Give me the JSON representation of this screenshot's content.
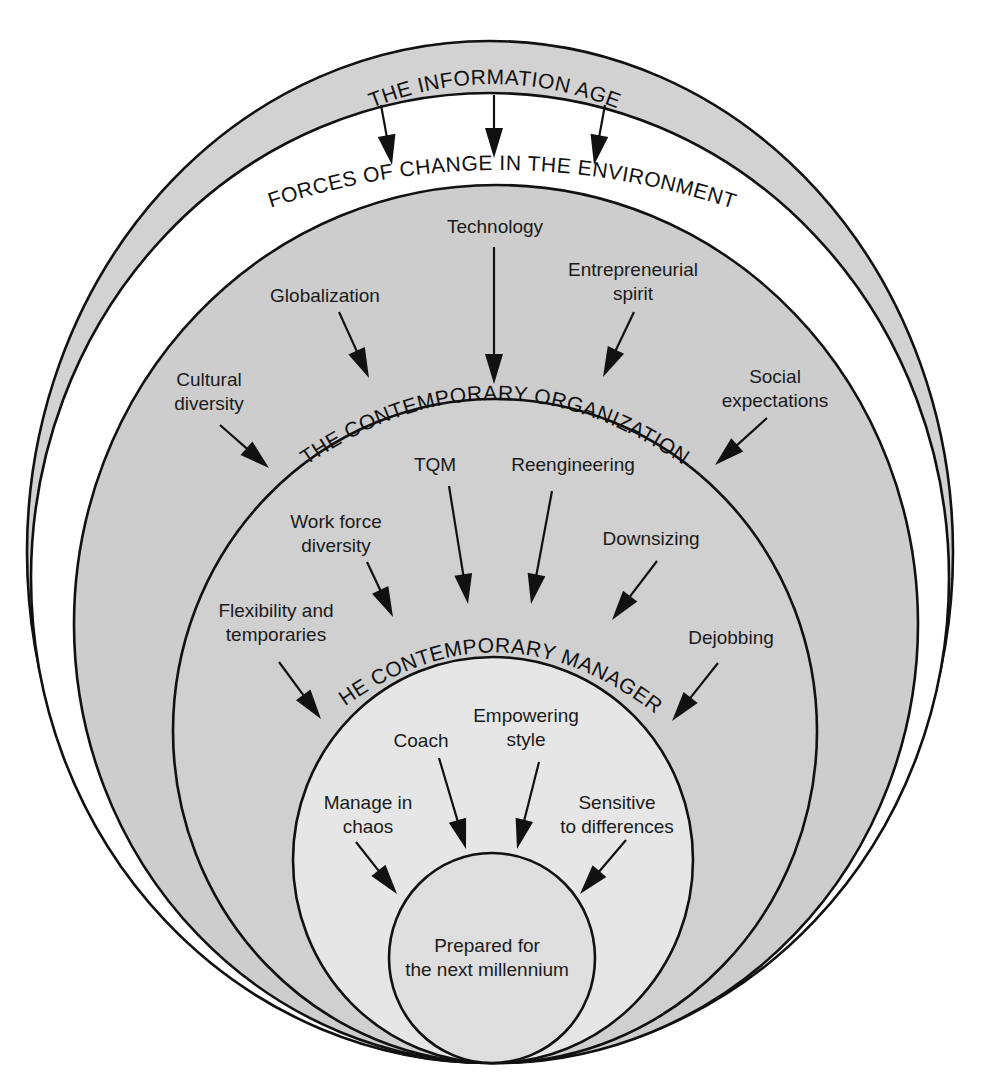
{
  "diagram": {
    "colors": {
      "outer_band": "#d2d2d2",
      "environment_band": "#ffffff",
      "environment_fill": "#cdcdcd",
      "organization_fill": "#d0d0d0",
      "manager_fill": "#e6e6e6",
      "core_fill": "#dedede",
      "line": "#111111"
    },
    "layers": [
      {
        "id": "information-age",
        "label": "THE INFORMATION AGE"
      },
      {
        "id": "environment",
        "label": "FORCES OF CHANGE IN THE ENVIRONMENT"
      },
      {
        "id": "organization",
        "label": "THE CONTEMPORARY ORGANIZATION"
      },
      {
        "id": "manager",
        "label": "THE CONTEMPORARY MANAGER"
      },
      {
        "id": "core",
        "label_lines": [
          "Prepared for",
          "the next millennium"
        ]
      }
    ],
    "environment_forces": [
      {
        "lines": [
          "Technology"
        ]
      },
      {
        "lines": [
          "Globalization"
        ]
      },
      {
        "lines": [
          "Entrepreneurial",
          "spirit"
        ]
      },
      {
        "lines": [
          "Cultural",
          "diversity"
        ]
      },
      {
        "lines": [
          "Social",
          "expectations"
        ]
      }
    ],
    "organization_forces": [
      {
        "lines": [
          "TQM"
        ]
      },
      {
        "lines": [
          "Reengineering"
        ]
      },
      {
        "lines": [
          "Work force",
          "diversity"
        ]
      },
      {
        "lines": [
          "Downsizing"
        ]
      },
      {
        "lines": [
          "Flexibility and",
          "temporaries"
        ]
      },
      {
        "lines": [
          "Dejobbing"
        ]
      }
    ],
    "manager_traits": [
      {
        "lines": [
          "Coach"
        ]
      },
      {
        "lines": [
          "Empowering",
          "style"
        ]
      },
      {
        "lines": [
          "Manage in",
          "chaos"
        ]
      },
      {
        "lines": [
          "Sensitive",
          "to differences"
        ]
      }
    ]
  }
}
